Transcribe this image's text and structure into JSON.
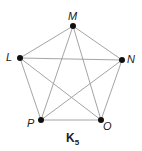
{
  "diagram": {
    "title": "K",
    "title_subscript": "5",
    "nodes": [
      {
        "id": "M",
        "label": "M",
        "x": 73,
        "y": 26
      },
      {
        "id": "L",
        "label": "L",
        "x": 20,
        "y": 58
      },
      {
        "id": "N",
        "label": "N",
        "x": 122,
        "y": 60
      },
      {
        "id": "P",
        "label": "P",
        "x": 41,
        "y": 120
      },
      {
        "id": "O",
        "label": "O",
        "x": 101,
        "y": 120
      }
    ],
    "edges": [
      [
        "M",
        "L"
      ],
      [
        "M",
        "N"
      ],
      [
        "M",
        "P"
      ],
      [
        "M",
        "O"
      ],
      [
        "L",
        "N"
      ],
      [
        "L",
        "P"
      ],
      [
        "L",
        "O"
      ],
      [
        "N",
        "P"
      ],
      [
        "N",
        "O"
      ],
      [
        "P",
        "O"
      ]
    ],
    "colors": {
      "edge": "#9a9a9a",
      "node": "#111111"
    }
  }
}
